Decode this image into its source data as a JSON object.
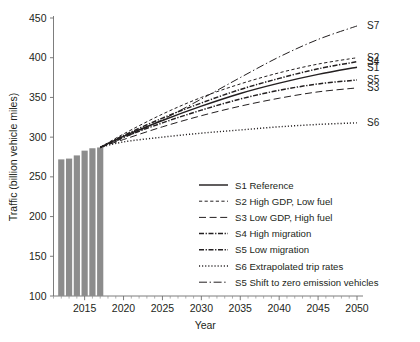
{
  "chart_data": {
    "type": "line",
    "title": "",
    "xlabel": "Year",
    "ylabel": "Traffic (billion vehicle miles)",
    "xlim": [
      2011,
      2050
    ],
    "ylim": [
      100,
      450
    ],
    "yticks": [
      100,
      150,
      200,
      250,
      300,
      350,
      400,
      450
    ],
    "xticks": [
      2015,
      2020,
      2025,
      2030,
      2035,
      2040,
      2045,
      2050
    ],
    "x_minor_tick_step": 1,
    "grid": false,
    "legend_position": "inside-lower-right",
    "bars": {
      "name": "Observed traffic",
      "color": "#8c8c8c",
      "x": [
        2012,
        2013,
        2014,
        2015,
        2016,
        2017
      ],
      "values": [
        272,
        273,
        277,
        283,
        286,
        287
      ]
    },
    "x": [
      2017,
      2020,
      2025,
      2030,
      2035,
      2040,
      2045,
      2050
    ],
    "series": [
      {
        "name": "S1",
        "label": "S1 Reference",
        "end_label": "S1",
        "style": "solid",
        "values": [
          287,
          301,
          321,
          339,
          355,
          368,
          379,
          388
        ],
        "end_value": 388
      },
      {
        "name": "S2",
        "label": "S2 High GDP, Low fuel",
        "end_label": "S2",
        "style": "fine-dash",
        "values": [
          287,
          304,
          329,
          350,
          367,
          381,
          392,
          400
        ],
        "end_value": 400
      },
      {
        "name": "S3",
        "label": "S3 Low GDP, High fuel",
        "end_label": "S3",
        "style": "long-dash",
        "values": [
          287,
          297,
          313,
          327,
          339,
          349,
          357,
          362
        ],
        "end_value": 362
      },
      {
        "name": "S4",
        "label": "S4 High migration",
        "end_label": "S4",
        "style": "dash-dot-dense",
        "values": [
          287,
          302,
          324,
          343,
          360,
          374,
          386,
          395
        ],
        "end_value": 395
      },
      {
        "name": "S5",
        "label": "S5 Low migration",
        "end_label": "S5",
        "style": "dash-dot-dense",
        "values": [
          287,
          300,
          318,
          334,
          348,
          359,
          367,
          372
        ],
        "end_value": 372
      },
      {
        "name": "S6",
        "label": "S6 Extrapolated trip rates",
        "end_label": "S6",
        "style": "dotted",
        "values": [
          287,
          294,
          300,
          305,
          309,
          313,
          316,
          318
        ],
        "end_value": 318
      },
      {
        "name": "S7",
        "label": "S5 Shift to zero emission vehicles",
        "end_label": "S7",
        "style": "dash-dot",
        "values": [
          287,
          299,
          322,
          348,
          375,
          401,
          423,
          440
        ],
        "end_value": 440
      }
    ],
    "legend": [
      {
        "key": "S1",
        "label": "S1 Reference",
        "style": "solid"
      },
      {
        "key": "S2",
        "label": "S2 High GDP, Low fuel",
        "style": "fine-dash"
      },
      {
        "key": "S3",
        "label": "S3 Low GDP, High fuel",
        "style": "long-dash"
      },
      {
        "key": "S4",
        "label": "S4 High migration",
        "style": "dash-dot-dense"
      },
      {
        "key": "S5",
        "label": "S5 Low migration",
        "style": "dash-dot-dense"
      },
      {
        "key": "S6",
        "label": "S6 Extrapolated trip rates",
        "style": "dotted"
      },
      {
        "key": "S7",
        "label": "S5 Shift to zero emission vehicles",
        "style": "dash-dot"
      }
    ],
    "colors": {
      "line": "#231f20",
      "bar": "#8c8c8c",
      "axis": "#6e6e6e",
      "background": "#ffffff"
    }
  }
}
